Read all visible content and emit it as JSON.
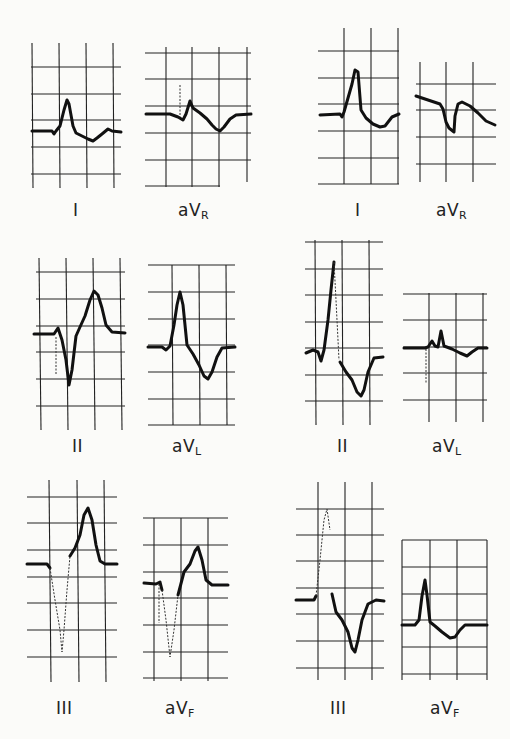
{
  "figure": {
    "columns": [
      "left",
      "right"
    ],
    "panels": [
      {
        "id": "left-I",
        "lead": "I",
        "sub": ""
      },
      {
        "id": "left-aVR",
        "lead": "aV",
        "sub": "R"
      },
      {
        "id": "right-I",
        "lead": "I",
        "sub": ""
      },
      {
        "id": "right-aVR",
        "lead": "aV",
        "sub": "R"
      },
      {
        "id": "left-II",
        "lead": "II",
        "sub": ""
      },
      {
        "id": "left-aVL",
        "lead": "aV",
        "sub": "L"
      },
      {
        "id": "right-II",
        "lead": "II",
        "sub": ""
      },
      {
        "id": "right-aVL",
        "lead": "aV",
        "sub": "L"
      },
      {
        "id": "left-III",
        "lead": "III",
        "sub": ""
      },
      {
        "id": "left-aVF",
        "lead": "aV",
        "sub": "F"
      },
      {
        "id": "right-III",
        "lead": "III",
        "sub": ""
      },
      {
        "id": "right-aVF",
        "lead": "aV",
        "sub": "F"
      }
    ]
  },
  "colors": {
    "background": "#fbfbf9",
    "grid": "#222222",
    "trace": "#111111"
  }
}
